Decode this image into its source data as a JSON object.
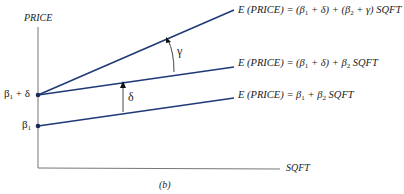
{
  "figure": {
    "caption": "(b)",
    "y_axis_label": "PRICE",
    "x_axis_label": "SQFT",
    "y_ticks": [
      {
        "label_base": "β",
        "label_sub": "1",
        "label_suffix": " + δ",
        "y_px": 95
      },
      {
        "label_base": "β",
        "label_sub": "1",
        "label_suffix": "",
        "y_px": 126
      }
    ],
    "lines": [
      {
        "name": "top",
        "equation": [
          "E (PRICE) = (β",
          "1",
          " + δ) + (β",
          "2",
          " + γ) SQFT"
        ]
      },
      {
        "name": "middle",
        "equation": [
          "E (PRICE) = (β",
          "1",
          " + δ) + β",
          "2",
          " SQFT"
        ]
      },
      {
        "name": "bottom",
        "equation": [
          "E (PRICE) = β",
          "1",
          " + β",
          "2",
          " SQFT"
        ]
      }
    ],
    "annotations": {
      "gamma": "γ",
      "delta": "δ"
    },
    "colors": {
      "line": "#1f3a78",
      "axis": "#666666",
      "text": "#222222"
    }
  }
}
